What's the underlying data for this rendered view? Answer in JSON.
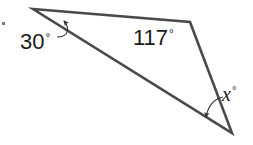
{
  "figure": {
    "type": "triangle-angle-diagram",
    "background_color": "#ffffff",
    "stroke_color": "#4a4a4a",
    "stroke_width": 2.6,
    "text_color": "#1a1a1a"
  },
  "vertices": {
    "left": {
      "x": 33,
      "y": 9
    },
    "top_right": {
      "x": 190,
      "y": 22
    },
    "bottom": {
      "x": 232,
      "y": 133
    }
  },
  "labels": {
    "left_angle": {
      "value": "30",
      "degree": "°",
      "full": "30°"
    },
    "top_right_angle": {
      "value": "117",
      "degree": "°",
      "full": "117°"
    },
    "bottom_angle": {
      "value": "x",
      "degree": "°",
      "full": "x°"
    }
  },
  "leaders": {
    "left_arrow": {
      "name": "leader-arrow-30",
      "path": "M 57 37 C 69 37 70 28 64 21",
      "arrow_tip": {
        "x": 63,
        "y": 20
      }
    },
    "bottom_arrow": {
      "name": "leader-arrow-x",
      "path": "M 223 97 C 213 99 208 107 206 117",
      "arrow_tip": {
        "x": 205,
        "y": 119
      }
    }
  },
  "marks": {
    "stray_dot": {
      "x": 3,
      "y": 23,
      "color": "#7a7a7a"
    }
  }
}
